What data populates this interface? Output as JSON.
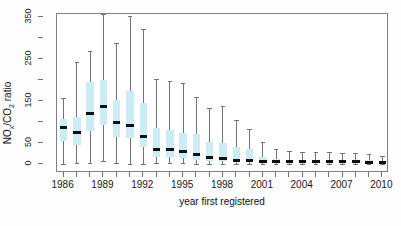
{
  "chart_data": {
    "type": "boxplot",
    "title": "",
    "xlabel": "year first registered",
    "ylabel": "NOx/CO2 ratio",
    "ylabel_parts": {
      "pre": "NO",
      "sub1": "x",
      "mid": "/CO",
      "sub2": "2",
      "post": " ratio"
    },
    "ylim": [
      0,
      350
    ],
    "ytick_values": [
      0,
      50,
      100,
      150,
      200,
      250,
      300,
      350
    ],
    "ytick_labels": [
      "0",
      "50",
      "",
      "150",
      "",
      "250",
      "",
      "350"
    ],
    "xlim": [
      1985.5,
      2010.5
    ],
    "categories": [
      1986,
      1987,
      1988,
      1989,
      1990,
      1991,
      1992,
      1993,
      1994,
      1995,
      1996,
      1997,
      1998,
      1999,
      2000,
      2001,
      2002,
      2003,
      2004,
      2005,
      2006,
      2007,
      2008,
      2009,
      2010
    ],
    "xtick_labels": [
      "1986",
      "",
      "",
      "1989",
      "",
      "",
      "1992",
      "",
      "",
      "1995",
      "",
      "",
      "1998",
      "",
      "",
      "2001",
      "",
      "",
      "2004",
      "",
      "",
      "2007",
      "",
      "",
      "2010"
    ],
    "grid": false,
    "legend": null,
    "box_fill_color": "#cbecf5",
    "median_color": "#101010",
    "whisker_color": "#6f7376",
    "frame_color": "#7d8184",
    "boxes": [
      {
        "year": 1986,
        "whisker_low": 0,
        "q1": 55,
        "median": 88,
        "q3": 108,
        "whisker_high": 158
      },
      {
        "year": 1987,
        "whisker_low": 3,
        "q1": 46,
        "median": 76,
        "q3": 113,
        "whisker_high": 243
      },
      {
        "year": 1988,
        "whisker_low": 3,
        "q1": 79,
        "median": 121,
        "q3": 196,
        "whisker_high": 268
      },
      {
        "year": 1989,
        "whisker_low": 6,
        "q1": 93,
        "median": 136,
        "q3": 199,
        "whisker_high": 357
      },
      {
        "year": 1990,
        "whisker_low": 2,
        "q1": 65,
        "median": 99,
        "q3": 152,
        "whisker_high": 288
      },
      {
        "year": 1991,
        "whisker_low": 1,
        "q1": 62,
        "median": 91,
        "q3": 173,
        "whisker_high": 352
      },
      {
        "year": 1992,
        "whisker_low": 0,
        "q1": 41,
        "median": 66,
        "q3": 145,
        "whisker_high": 322
      },
      {
        "year": 1993,
        "whisker_low": 2,
        "q1": 17,
        "median": 34,
        "q3": 85,
        "whisker_high": 202
      },
      {
        "year": 1994,
        "whisker_low": 2,
        "q1": 17,
        "median": 34,
        "q3": 80,
        "whisker_high": 198
      },
      {
        "year": 1995,
        "whisker_low": 2,
        "q1": 14,
        "median": 29,
        "q3": 73,
        "whisker_high": 193
      },
      {
        "year": 1996,
        "whisker_low": 1,
        "q1": 10,
        "median": 22,
        "q3": 72,
        "whisker_high": 160
      },
      {
        "year": 1997,
        "whisker_low": 1,
        "q1": 7,
        "median": 15,
        "q3": 52,
        "whisker_high": 133
      },
      {
        "year": 1998,
        "whisker_low": 1,
        "q1": 6,
        "median": 13,
        "q3": 51,
        "whisker_high": 137
      },
      {
        "year": 1999,
        "whisker_low": 1,
        "q1": 4,
        "median": 9,
        "q3": 40,
        "whisker_high": 104
      },
      {
        "year": 2000,
        "whisker_low": 1,
        "q1": 4,
        "median": 9,
        "q3": 35,
        "whisker_high": 84
      },
      {
        "year": 2001,
        "whisker_low": 1,
        "q1": 3,
        "median": 6,
        "q3": 16,
        "whisker_high": 53
      },
      {
        "year": 2002,
        "whisker_low": 1,
        "q1": 3,
        "median": 5,
        "q3": 11,
        "whisker_high": 36
      },
      {
        "year": 2003,
        "whisker_low": 1,
        "q1": 2,
        "median": 5,
        "q3": 10,
        "whisker_high": 30
      },
      {
        "year": 2004,
        "whisker_low": 1,
        "q1": 2,
        "median": 5,
        "q3": 10,
        "whisker_high": 29
      },
      {
        "year": 2005,
        "whisker_low": 1,
        "q1": 2,
        "median": 5,
        "q3": 10,
        "whisker_high": 28
      },
      {
        "year": 2006,
        "whisker_low": 1,
        "q1": 2,
        "median": 5,
        "q3": 10,
        "whisker_high": 28
      },
      {
        "year": 2007,
        "whisker_low": 1,
        "q1": 2,
        "median": 5,
        "q3": 10,
        "whisker_high": 27
      },
      {
        "year": 2008,
        "whisker_low": 1,
        "q1": 2,
        "median": 5,
        "q3": 10,
        "whisker_high": 27
      },
      {
        "year": 2009,
        "whisker_low": 1,
        "q1": 2,
        "median": 4,
        "q3": 9,
        "whisker_high": 25
      },
      {
        "year": 2010,
        "whisker_low": 1,
        "q1": 2,
        "median": 4,
        "q3": 8,
        "whisker_high": 20
      }
    ]
  }
}
